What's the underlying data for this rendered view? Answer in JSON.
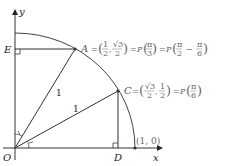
{
  "diagram": {
    "type": "unit-circle-quadrant",
    "axes": {
      "x_label": "x",
      "y_label": "y",
      "origin_label": "O"
    },
    "points": {
      "A": {
        "label": "A",
        "equation": "= (1/2, √3/2) = P(π/3) = P(π/2 − π/6)"
      },
      "C": {
        "label": "C",
        "equation": "= (√3/2, 1/2) = P(π/6)"
      },
      "D": {
        "label": "D"
      },
      "E": {
        "label": "E"
      },
      "unit": {
        "label": "(1, 0)"
      }
    },
    "segment_labels": {
      "OA": "1",
      "OC": "1"
    },
    "colors": {
      "lines": "#333333",
      "equation_text": "#666666",
      "points": "#333333"
    }
  }
}
